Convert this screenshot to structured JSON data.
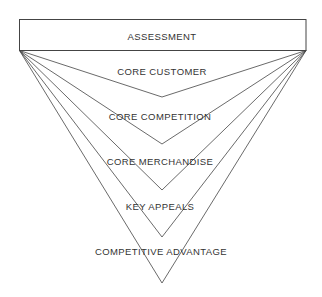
{
  "diagram": {
    "type": "inverted-funnel",
    "header": "ASSESSMENT",
    "levels": [
      {
        "label": "CORE CUSTOMER"
      },
      {
        "label": "CORE COMPETITION"
      },
      {
        "label": "CORE MERCHANDISE"
      },
      {
        "label": "KEY APPEALS"
      },
      {
        "label": "COMPETITIVE ADVANTAGE"
      }
    ],
    "colors": {
      "line": "#444444",
      "text": "#333333",
      "background": "#ffffff"
    }
  }
}
